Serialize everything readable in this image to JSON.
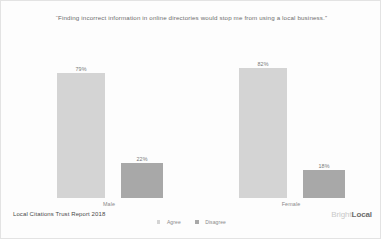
{
  "chart_data": {
    "type": "bar",
    "title": "“Finding incorrect information in online directories would stop me from using a local business.”",
    "xlabel": "",
    "ylabel": "",
    "ylim": [
      0,
      100
    ],
    "grid": false,
    "legend_position": "bottom-center",
    "categories": [
      "Male",
      "Female"
    ],
    "series": [
      {
        "name": "Agree",
        "color": "#d4d4d4",
        "values": [
          79,
          82
        ],
        "labels": [
          "79%",
          "82%"
        ]
      },
      {
        "name": "Disagree",
        "color": "#a8a8a8",
        "values": [
          22,
          18
        ],
        "labels": [
          "22%",
          "18%"
        ]
      }
    ]
  },
  "footer": {
    "source": "Local Citations Trust Report 2018",
    "brand_primary": "Bright",
    "brand_secondary": "Local"
  }
}
